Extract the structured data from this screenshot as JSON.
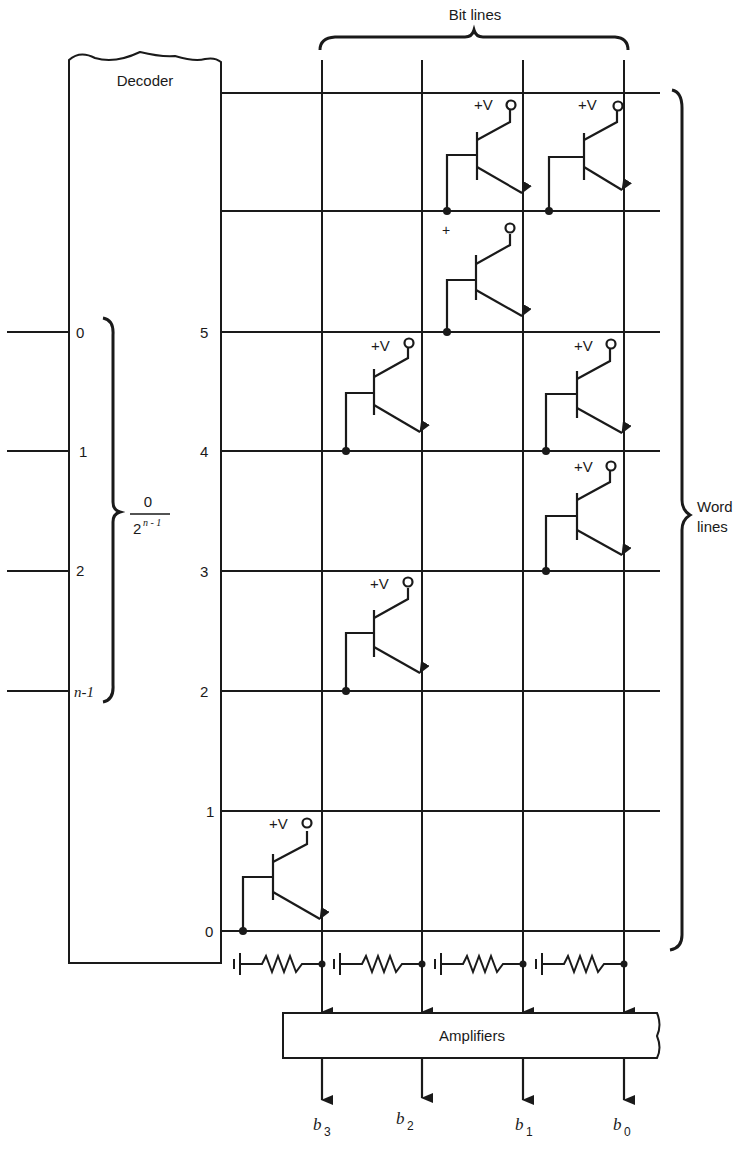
{
  "diagram": {
    "decoder": {
      "label": "Decoder"
    },
    "bit_lines_label": "Bit lines",
    "word_lines_label": [
      "Word",
      "lines"
    ],
    "amplifiers_label": "Amplifiers",
    "inputs": [
      {
        "label": "0"
      },
      {
        "label": "1"
      },
      {
        "label": "2"
      },
      {
        "label": "n-1"
      }
    ],
    "input_brace_fraction": {
      "numerator": "0",
      "denominator_base": "2",
      "denominator_exp": "n - 1"
    },
    "word_lines": [
      {
        "label": "",
        "y": 93
      },
      {
        "label": "",
        "y": 211
      },
      {
        "label": "5",
        "y": 332
      },
      {
        "label": "4",
        "y": 451
      },
      {
        "label": "3",
        "y": 571
      },
      {
        "label": "2",
        "y": 691
      },
      {
        "label": "1",
        "y": 811
      },
      {
        "label": "0",
        "y": 931
      }
    ],
    "bit_lines": [
      {
        "name": "b",
        "sub": "3",
        "x": 322
      },
      {
        "name": "b",
        "sub": "2",
        "x": 422
      },
      {
        "name": "b",
        "sub": "1",
        "x": 523
      },
      {
        "name": "b",
        "sub": "0",
        "x": 624
      }
    ],
    "supply_label": "+V",
    "partial_supply_label": "+",
    "transistors": [
      {
        "row": 0,
        "col": 2,
        "supply": "+V"
      },
      {
        "row": 0,
        "col": 3,
        "supply": "+V"
      },
      {
        "row": 1,
        "col": 2,
        "supply": "+"
      },
      {
        "row": 2,
        "col": 1,
        "supply": "+V"
      },
      {
        "row": 2,
        "col": 3,
        "supply": "+V"
      },
      {
        "row": 3,
        "col": 3,
        "supply": "+V"
      },
      {
        "row": 4,
        "col": 1,
        "supply": "+V"
      },
      {
        "row": 6,
        "col": 0,
        "supply": "+V"
      }
    ]
  }
}
